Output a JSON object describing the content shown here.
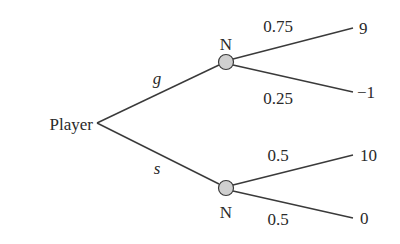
{
  "diagram": {
    "type": "game-tree",
    "root": {
      "label": "Player"
    },
    "actions": [
      {
        "label": "g"
      },
      {
        "label": "s"
      }
    ],
    "chance_nodes": [
      {
        "label": "N",
        "outcomes": [
          {
            "probability": "0.75",
            "payoff": "9"
          },
          {
            "probability": "0.25",
            "payoff": "−1"
          }
        ]
      },
      {
        "label": "N",
        "outcomes": [
          {
            "probability": "0.5",
            "payoff": "10"
          },
          {
            "probability": "0.5",
            "payoff": "0"
          }
        ]
      }
    ],
    "colors": {
      "node_fill": "#cfcfcf",
      "line": "#3a3a3a",
      "text": "#2a2a2a"
    }
  }
}
